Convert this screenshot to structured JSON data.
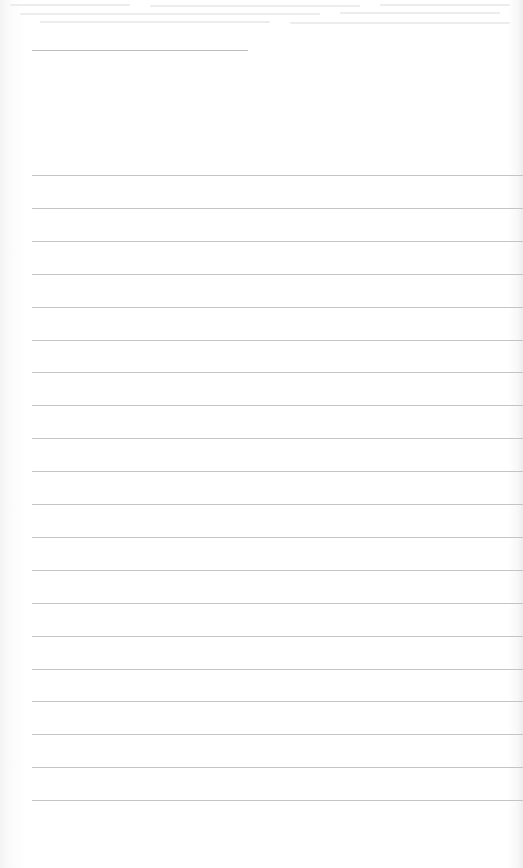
{
  "document": {
    "type": "lined-paper",
    "background_color": "#ffffff",
    "line_color": "#c4c4c4",
    "header_line": {
      "x": 32,
      "y": 50,
      "width": 216
    },
    "ruled_lines": {
      "count": 20,
      "start_x": 32,
      "first_y": 175,
      "spacing": 32.9
    },
    "content": ""
  }
}
